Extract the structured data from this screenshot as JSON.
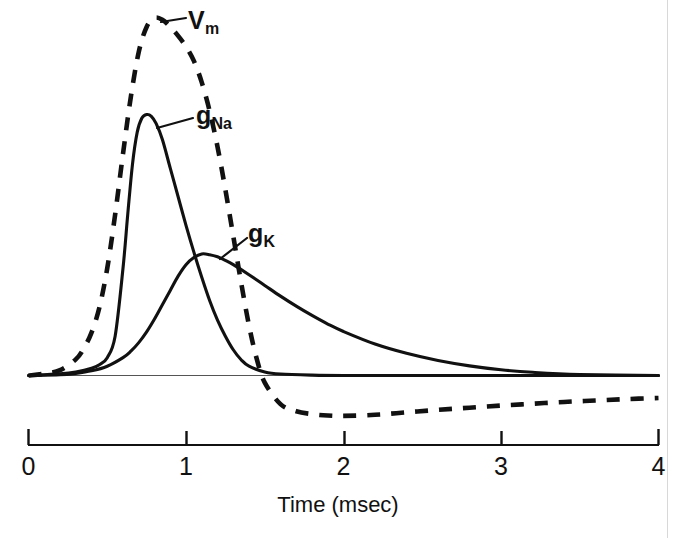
{
  "figure": {
    "title": "",
    "background_color": "#ffffff",
    "ink_color": "#111111"
  },
  "axis": {
    "title": "Time (msec)",
    "tick_labels": [
      "0",
      "1",
      "2",
      "3",
      "4"
    ],
    "tick_values": [
      0,
      1,
      2,
      3,
      4
    ],
    "unit": "msec"
  },
  "labels": {
    "vm": {
      "base": "V",
      "sub": "m"
    },
    "gna": {
      "base": "g",
      "sub": "Na"
    },
    "gk": {
      "base": "g",
      "sub": "K"
    }
  },
  "chart_data": {
    "type": "line",
    "title": "",
    "xlabel": "Time (msec)",
    "ylabel": "",
    "xlim": [
      0,
      4
    ],
    "ylim": [
      -0.25,
      1.05
    ],
    "grid": false,
    "legend": "inline-annotations",
    "xticks": [
      0,
      1,
      2,
      3,
      4
    ],
    "xticklabels": [
      "0",
      "1",
      "2",
      "3",
      "4"
    ],
    "yticks": [],
    "baseline_y": 0,
    "series": [
      {
        "name": "V_m",
        "label": "Vm",
        "style": "dashed",
        "color": "#111111",
        "description": "Membrane potential action potential with depolarization peak near 0.78 msec and hyperpolarizing undershoot near 2.0 msec",
        "peak_x": 0.78,
        "peak_y": 1.0,
        "trough_x": 2.0,
        "trough_y": -0.11,
        "x": [
          0.0,
          0.1,
          0.2,
          0.3,
          0.35,
          0.4,
          0.45,
          0.5,
          0.55,
          0.6,
          0.65,
          0.7,
          0.75,
          0.8,
          0.85,
          0.9,
          0.95,
          1.0,
          1.05,
          1.1,
          1.15,
          1.2,
          1.25,
          1.3,
          1.35,
          1.4,
          1.45,
          1.5,
          1.6,
          1.7,
          1.8,
          1.9,
          2.0,
          2.2,
          2.4,
          2.6,
          2.8,
          3.0,
          3.2,
          3.4,
          3.6,
          3.8,
          4.0
        ],
        "y": [
          0.0,
          0.005,
          0.015,
          0.045,
          0.075,
          0.12,
          0.19,
          0.3,
          0.45,
          0.62,
          0.78,
          0.905,
          0.975,
          1.0,
          0.995,
          0.975,
          0.95,
          0.92,
          0.88,
          0.82,
          0.74,
          0.64,
          0.52,
          0.39,
          0.26,
          0.14,
          0.045,
          -0.02,
          -0.08,
          -0.1,
          -0.108,
          -0.112,
          -0.113,
          -0.11,
          -0.103,
          -0.096,
          -0.09,
          -0.084,
          -0.079,
          -0.074,
          -0.07,
          -0.066,
          -0.063
        ]
      },
      {
        "name": "g_Na",
        "label": "gNa",
        "style": "solid",
        "color": "#111111",
        "description": "Sodium conductance: fast sharp rise peaking near 0.75 msec then rapid inactivation back to baseline by about 1.4 msec",
        "peak_x": 0.75,
        "peak_y": 0.73,
        "x": [
          0.0,
          0.2,
          0.3,
          0.4,
          0.45,
          0.5,
          0.55,
          0.6,
          0.63,
          0.66,
          0.69,
          0.72,
          0.75,
          0.78,
          0.81,
          0.85,
          0.9,
          0.95,
          1.0,
          1.05,
          1.1,
          1.15,
          1.2,
          1.25,
          1.3,
          1.35,
          1.4,
          1.5,
          1.6,
          1.8,
          2.0,
          2.5,
          3.0,
          3.5,
          4.0
        ],
        "y": [
          0.0,
          0.005,
          0.01,
          0.02,
          0.03,
          0.05,
          0.11,
          0.3,
          0.45,
          0.59,
          0.68,
          0.72,
          0.73,
          0.725,
          0.705,
          0.66,
          0.58,
          0.5,
          0.42,
          0.345,
          0.275,
          0.21,
          0.155,
          0.11,
          0.072,
          0.044,
          0.026,
          0.01,
          0.004,
          0.001,
          0.0,
          0.0,
          0.0,
          0.0,
          0.0
        ]
      },
      {
        "name": "g_K",
        "label": "gK",
        "style": "solid",
        "color": "#111111",
        "description": "Potassium conductance: slower delayed rise peaking near 1.1 msec followed by slow exponential decay to baseline by about 3 msec",
        "peak_x": 1.1,
        "peak_y": 0.34,
        "x": [
          0.0,
          0.2,
          0.3,
          0.4,
          0.5,
          0.6,
          0.65,
          0.7,
          0.75,
          0.8,
          0.85,
          0.9,
          0.95,
          1.0,
          1.05,
          1.1,
          1.15,
          1.2,
          1.25,
          1.3,
          1.4,
          1.5,
          1.6,
          1.7,
          1.8,
          1.9,
          2.0,
          2.2,
          2.4,
          2.6,
          2.8,
          3.0,
          3.2,
          3.5,
          4.0
        ],
        "y": [
          0.0,
          0.002,
          0.006,
          0.013,
          0.026,
          0.05,
          0.068,
          0.092,
          0.122,
          0.158,
          0.198,
          0.238,
          0.278,
          0.31,
          0.33,
          0.34,
          0.338,
          0.332,
          0.322,
          0.31,
          0.282,
          0.252,
          0.222,
          0.194,
          0.168,
          0.144,
          0.123,
          0.088,
          0.062,
          0.042,
          0.027,
          0.016,
          0.009,
          0.003,
          0.0
        ]
      }
    ]
  }
}
